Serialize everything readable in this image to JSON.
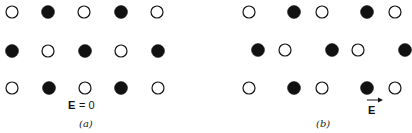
{
  "figure": {
    "panels": [
      {
        "id": "a",
        "caption": "(a)",
        "field_label": "E",
        "field_value_text": "= 0",
        "rows": [
          {
            "y": 12,
            "atoms": [
              {
                "x": 12,
                "type": "open"
              },
              {
                "x": 48,
                "type": "filled"
              },
              {
                "x": 84,
                "type": "open"
              },
              {
                "x": 121,
                "type": "filled"
              },
              {
                "x": 157,
                "type": "open"
              }
            ]
          },
          {
            "y": 51,
            "atoms": [
              {
                "x": 12,
                "type": "filled"
              },
              {
                "x": 48,
                "type": "open"
              },
              {
                "x": 85,
                "type": "filled"
              },
              {
                "x": 121,
                "type": "open"
              },
              {
                "x": 158,
                "type": "filled"
              }
            ]
          },
          {
            "y": 88,
            "atoms": [
              {
                "x": 12,
                "type": "open"
              },
              {
                "x": 49,
                "type": "filled"
              },
              {
                "x": 85,
                "type": "open"
              },
              {
                "x": 121,
                "type": "filled"
              },
              {
                "x": 158,
                "type": "open"
              }
            ]
          }
        ]
      },
      {
        "id": "b",
        "caption": "(b)",
        "field_label": "E",
        "field_arrow": "right",
        "rows": [
          {
            "y": 12,
            "atoms": [
              {
                "x": 249,
                "type": "open"
              },
              {
                "x": 294,
                "type": "filled"
              },
              {
                "x": 322,
                "type": "open"
              },
              {
                "x": 367,
                "type": "filled"
              },
              {
                "x": 395,
                "type": "open"
              }
            ]
          },
          {
            "y": 50,
            "atoms": [
              {
                "x": 258,
                "type": "filled"
              },
              {
                "x": 285,
                "type": "open"
              },
              {
                "x": 332,
                "type": "filled"
              },
              {
                "x": 358,
                "type": "open"
              },
              {
                "x": 405,
                "type": "filled"
              }
            ]
          },
          {
            "y": 88,
            "atoms": [
              {
                "x": 249,
                "type": "open"
              },
              {
                "x": 294,
                "type": "filled"
              },
              {
                "x": 322,
                "type": "open"
              },
              {
                "x": 367,
                "type": "filled"
              },
              {
                "x": 395,
                "type": "open"
              }
            ]
          }
        ]
      }
    ],
    "colors": {
      "ink": "#111111",
      "background": "#ffffff"
    }
  }
}
